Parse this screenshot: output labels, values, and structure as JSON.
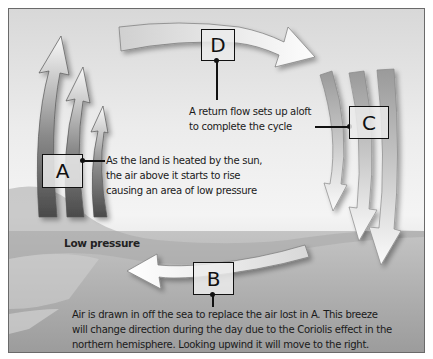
{
  "diagram": {
    "colors": {
      "frame": "#6a6a6a",
      "arrow_dark": "#555555",
      "arrow_light": "#f8f8f8",
      "sea": "#b0b0b0",
      "text": "#1a1a1a"
    },
    "labels": {
      "A": {
        "letter": "A",
        "text_lines": [
          "As the land is heated by the sun,",
          "the air above it starts to rise",
          "causing an area of low pressure"
        ]
      },
      "B": {
        "letter": "B",
        "text_lines": [
          "Air is drawn in off the sea to replace the air lost in A. This breeze",
          "will change direction during the day due to the Coriolis effect in the",
          "northern hemisphere. Looking upwind it will move to the right."
        ]
      },
      "C": {
        "letter": "C",
        "text_lines": []
      },
      "D": {
        "letter": "D",
        "text_lines": [
          "A return flow sets up aloft",
          "to complete the cycle"
        ]
      }
    },
    "low_pressure_label": "Low pressure",
    "flows": [
      {
        "id": "A",
        "direction": "up",
        "description": "rising air over land"
      },
      {
        "id": "D",
        "direction": "right",
        "description": "return flow aloft"
      },
      {
        "id": "C",
        "direction": "down",
        "description": "sinking air over sea"
      },
      {
        "id": "B",
        "direction": "left",
        "description": "sea breeze toward land"
      }
    ]
  }
}
